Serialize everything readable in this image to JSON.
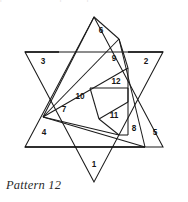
{
  "figure": {
    "title": "Pattern 12",
    "caption": "Pattern 12",
    "clipped_header_text": "puzzle  solution  ·  pattern  pieces",
    "type": "geometric-dissection-diagram",
    "shape": "hexagram-star-of-david",
    "line_color": "#1b1b1b",
    "background_color": "#ffffff",
    "label_color": "#161616",
    "piece_count": 12,
    "star": {
      "outer_points": [
        {
          "name": "top-apex",
          "x": 94,
          "y": 17
        },
        {
          "name": "upper-right-point",
          "x": 163,
          "y": 52
        },
        {
          "name": "right-lower-point",
          "x": 163,
          "y": 147
        },
        {
          "name": "bottom-apex",
          "x": 94,
          "y": 182
        },
        {
          "name": "left-lower-point",
          "x": 25,
          "y": 147
        },
        {
          "name": "upper-left-point",
          "x": 25,
          "y": 52
        }
      ],
      "hexagon_vertices": [
        {
          "name": "hex-top-left",
          "x": 59,
          "y": 52
        },
        {
          "name": "hex-top-right",
          "x": 128,
          "y": 52
        },
        {
          "name": "hex-right",
          "x": 163,
          "y": 100
        },
        {
          "name": "hex-bottom-right",
          "x": 128,
          "y": 147
        },
        {
          "name": "hex-bottom-left",
          "x": 59,
          "y": 147
        },
        {
          "name": "hex-left",
          "x": 25,
          "y": 100
        }
      ],
      "upward_triangle": [
        {
          "x": 94,
          "y": 17
        },
        {
          "x": 163,
          "y": 147
        },
        {
          "x": 25,
          "y": 147
        }
      ],
      "downward_triangle": [
        {
          "x": 94,
          "y": 182
        },
        {
          "x": 25,
          "y": 52
        },
        {
          "x": 163,
          "y": 52
        }
      ]
    },
    "regions": [
      {
        "id": 1,
        "label": "1",
        "label_x": 94,
        "label_y": 165,
        "description": "bottom star point"
      },
      {
        "id": 2,
        "label": "2",
        "label_x": 146,
        "label_y": 62,
        "description": "upper-right star point"
      },
      {
        "id": 3,
        "label": "3",
        "label_x": 43,
        "label_y": 62,
        "description": "upper-left star point"
      },
      {
        "id": 4,
        "label": "4",
        "label_x": 44,
        "label_y": 133,
        "description": "lower-left wedge"
      },
      {
        "id": 5,
        "label": "5",
        "label_x": 155,
        "label_y": 133,
        "description": "lower-right star point"
      },
      {
        "id": 6,
        "label": "6",
        "label_x": 101,
        "label_y": 31,
        "description": "top spiral wedge"
      },
      {
        "id": 7,
        "label": "7",
        "label_x": 64,
        "label_y": 110,
        "description": "left inner spiral wedge"
      },
      {
        "id": 8,
        "label": "8",
        "label_x": 134,
        "label_y": 129,
        "description": "right lower spiral wedge"
      },
      {
        "id": 9,
        "label": "9",
        "label_x": 114,
        "label_y": 59,
        "description": "upper-right spiral wedge"
      },
      {
        "id": 10,
        "label": "10",
        "label_x": 80,
        "label_y": 97,
        "description": "inner-left spiral wedge"
      },
      {
        "id": 11,
        "label": "11",
        "label_x": 114,
        "label_y": 116,
        "description": "inner-lower spiral wedge"
      },
      {
        "id": 12,
        "label": "12",
        "label_x": 116,
        "label_y": 82,
        "description": "inner-upper spiral wedge"
      }
    ],
    "spiral_nodes": [
      {
        "name": "P-top-apex",
        "x": 94,
        "y": 17
      },
      {
        "name": "P-upper-right",
        "x": 119,
        "y": 39
      },
      {
        "name": "P-right-mid",
        "x": 128,
        "y": 68
      },
      {
        "name": "P-left-hub",
        "x": 43,
        "y": 117
      },
      {
        "name": "P-bottom-right",
        "x": 145,
        "y": 147
      },
      {
        "name": "P-bottom-mid",
        "x": 119,
        "y": 135
      },
      {
        "name": "P-inner-topleft",
        "x": 90,
        "y": 88
      },
      {
        "name": "P-inner-topright",
        "x": 128,
        "y": 88
      },
      {
        "name": "P-inner-right",
        "x": 128,
        "y": 102
      },
      {
        "name": "P-inner-bottom",
        "x": 99,
        "y": 119
      },
      {
        "name": "P-bottom-left",
        "x": 25,
        "y": 147
      }
    ]
  }
}
